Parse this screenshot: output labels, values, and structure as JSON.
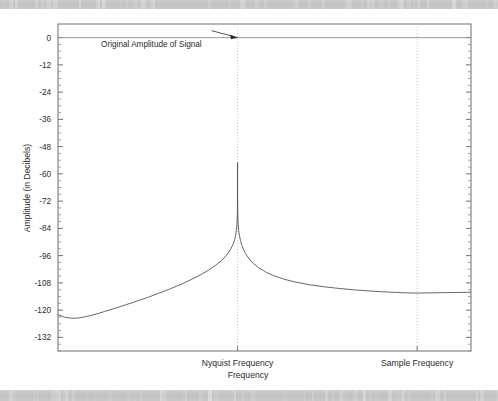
{
  "figure": {
    "background_color": "#ffffff",
    "scan_band_color": "#c3c3c3",
    "axes_color": "#6f6f6f",
    "curve_color": "#555555",
    "guide_color": "#c0c0c0",
    "text_color": "#2b2b2b"
  },
  "chart_data": {
    "type": "line",
    "title": "",
    "xlabel": "Frequency",
    "ylabel": "Amplitude (in Decibels)",
    "ylim": [
      -138,
      6
    ],
    "xlim": [
      0,
      1.15
    ],
    "grid": false,
    "legend": "none",
    "ytick_labels": [
      "0",
      "-12",
      "-24",
      "-36",
      "-48",
      "-60",
      "-72",
      "-84",
      "-96",
      "-108",
      "-120",
      "-132"
    ],
    "ytick_values": [
      0,
      -12,
      -24,
      -36,
      -48,
      -60,
      -72,
      -84,
      -96,
      -108,
      -120,
      -132
    ],
    "minor_ticks": true,
    "xtick_labels": [
      "Nyquist Frequency",
      "Sample Frequency"
    ],
    "xtick_values": [
      0.5,
      1.0
    ],
    "annotations": [
      {
        "text": "Original Amplitude of Signal",
        "x": 0.12,
        "y": 0,
        "arrow_to_x": 0.5,
        "arrow_to_y": 0
      }
    ],
    "reference_lines": [
      {
        "name": "original-amplitude-line",
        "orientation": "horizontal",
        "value": 0,
        "style": "solid"
      },
      {
        "name": "nyquist-frequency-line",
        "orientation": "vertical",
        "value": 0.5,
        "style": "dotted"
      },
      {
        "name": "sample-frequency-line",
        "orientation": "vertical",
        "value": 1.0,
        "style": "dotted"
      }
    ],
    "series": [
      {
        "name": "Aliasing Amplitude Response",
        "x": [
          0.0,
          0.02,
          0.04,
          0.06,
          0.08,
          0.1,
          0.13,
          0.16,
          0.19,
          0.22,
          0.25,
          0.28,
          0.31,
          0.34,
          0.37,
          0.4,
          0.42,
          0.44,
          0.455,
          0.465,
          0.475,
          0.482,
          0.488,
          0.492,
          0.495,
          0.497,
          0.4985,
          0.4995,
          0.4999,
          0.5,
          0.5001,
          0.5005,
          0.5015,
          0.503,
          0.505,
          0.508,
          0.512,
          0.518,
          0.525,
          0.535,
          0.545,
          0.56,
          0.58,
          0.6,
          0.63,
          0.66,
          0.7,
          0.74,
          0.78,
          0.82,
          0.86,
          0.9,
          0.94,
          0.97,
          1.0,
          1.04,
          1.08,
          1.12,
          1.15
        ],
        "y": [
          -122.0,
          -123.2,
          -123.6,
          -123.4,
          -122.8,
          -122.0,
          -120.6,
          -119.1,
          -117.6,
          -116.0,
          -114.4,
          -112.6,
          -110.8,
          -108.8,
          -106.6,
          -104.2,
          -102.3,
          -100.1,
          -98.2,
          -96.6,
          -94.6,
          -92.8,
          -90.8,
          -89.0,
          -86.6,
          -84.2,
          -81.8,
          -76.5,
          -68.0,
          -55.0,
          -68.0,
          -76.5,
          -81.8,
          -84.8,
          -87.0,
          -89.3,
          -91.5,
          -93.8,
          -95.8,
          -98.0,
          -99.6,
          -101.4,
          -103.4,
          -104.8,
          -106.4,
          -107.6,
          -108.8,
          -109.7,
          -110.4,
          -111.0,
          -111.5,
          -111.9,
          -112.2,
          -112.4,
          -112.5,
          -112.4,
          -112.3,
          -112.2,
          -112.1
        ]
      }
    ]
  }
}
